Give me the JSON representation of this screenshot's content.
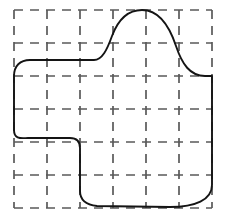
{
  "figure": {
    "background_color": "#ffffff",
    "width": 227,
    "height": 218
  },
  "grid": {
    "name": "dashed-square-grid",
    "line_color": "#5a5a5a",
    "line_width": 1.7,
    "dash_pattern": "9 7",
    "cells_x": 6,
    "cells_y": 6,
    "spacing": 33,
    "origin_x": 14,
    "origin_y": 10,
    "vertical_line_positions": [
      14,
      47,
      80,
      113,
      146,
      179,
      212
    ],
    "horizontal_line_positions": [
      10,
      43,
      76,
      109,
      142,
      175,
      208
    ]
  },
  "shape": {
    "name": "closed-region-outline",
    "stroke_color": "#141414",
    "stroke_width": 1.9,
    "fill": "none",
    "closed": true,
    "description": "Irregular rounded closed curve resembling a blob with a tall bump at the top-right-center, a notch cut from the lower-left, and a slight sag along the bottom edge.",
    "path": "M 14,76 L 14,130 C 14,140 22,138 28,138 L 70,138 C 77,138 80,141 80,148 L 80,191 C 80,201 88,205 97,206 L 170,207 C 195,207 212,200 212,185 L 212,76 L 205,76 C 190,76 182,64 176,46 C 168,22 156,10 142,10 C 128,10 118,20 112,36 C 107,50 102,60 94,60 L 30,60 C 20,60 14,66 14,76 Z",
    "anchor_points": [
      {
        "x": 14,
        "y": 76
      },
      {
        "x": 14,
        "y": 130
      },
      {
        "x": 28,
        "y": 138
      },
      {
        "x": 70,
        "y": 138
      },
      {
        "x": 80,
        "y": 148
      },
      {
        "x": 80,
        "y": 191
      },
      {
        "x": 97,
        "y": 206
      },
      {
        "x": 170,
        "y": 207
      },
      {
        "x": 212,
        "y": 185
      },
      {
        "x": 212,
        "y": 76
      },
      {
        "x": 176,
        "y": 46
      },
      {
        "x": 142,
        "y": 10
      },
      {
        "x": 112,
        "y": 36
      },
      {
        "x": 94,
        "y": 60
      },
      {
        "x": 30,
        "y": 60
      }
    ]
  }
}
